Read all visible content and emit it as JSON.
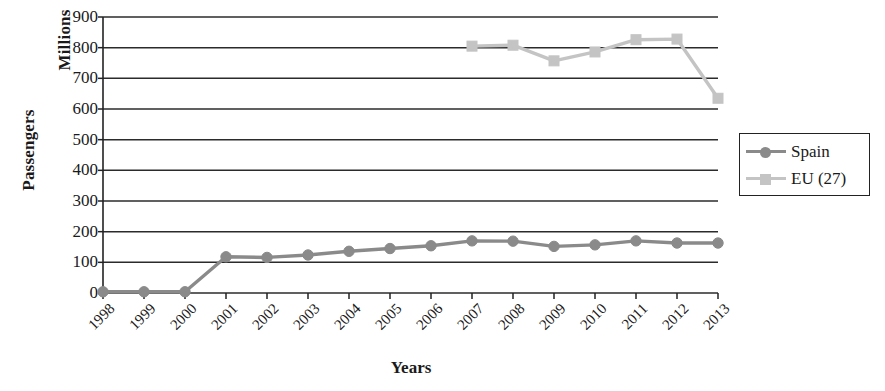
{
  "chart_data": {
    "type": "line",
    "title": "",
    "xlabel": "Years",
    "ylabel": "Passengers",
    "ylabel_secondary": "Millions",
    "categories": [
      "1998",
      "1999",
      "2000",
      "2001",
      "2002",
      "2003",
      "2004",
      "2005",
      "2006",
      "2007",
      "2008",
      "2009",
      "2010",
      "2011",
      "2012",
      "2013"
    ],
    "ylim": [
      0,
      900
    ],
    "ytick_labels": [
      "900",
      "800",
      "700",
      "600",
      "500",
      "400",
      "300",
      "200",
      "100",
      "0"
    ],
    "ytick_values": [
      900,
      800,
      700,
      600,
      500,
      400,
      300,
      200,
      100,
      0
    ],
    "grid": "horizontal",
    "legend_position": "right",
    "series": [
      {
        "name": "Spain",
        "color": "#8a8a8a",
        "marker": "circle",
        "values": [
          4,
          4,
          4,
          118,
          116,
          124,
          136,
          145,
          154,
          170,
          169,
          152,
          157,
          170,
          163,
          163
        ]
      },
      {
        "name": "EU (27)",
        "color": "#c4c4c4",
        "marker": "square",
        "values": [
          null,
          null,
          null,
          null,
          null,
          null,
          null,
          null,
          null,
          805,
          808,
          757,
          786,
          826,
          828,
          635
        ]
      }
    ]
  },
  "legend": {
    "items": [
      {
        "label": "Spain",
        "icon": "line-circle-marker-icon"
      },
      {
        "label": "EU (27)",
        "icon": "line-square-marker-icon"
      }
    ]
  },
  "axis_titles": {
    "y_primary": "Passengers",
    "y_secondary": "Millions",
    "x": "Years"
  },
  "colors": {
    "spain": "#8a8a8a",
    "eu27": "#c4c4c4",
    "axis": "#222222",
    "grid": "#2b2b2b",
    "background": "#ffffff"
  }
}
